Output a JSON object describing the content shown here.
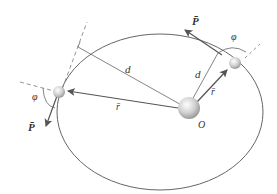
{
  "diagram": {
    "labels": {
      "momentum_right": "P̄",
      "momentum_left": "P̄",
      "angle_right": "φ",
      "angle_left": "φ",
      "distance_upper": "d",
      "distance_right": "d",
      "radius_left": "r̄",
      "radius_right": "r̄",
      "origin": "O"
    },
    "colors": {
      "orbit": "#555555",
      "arrow": "#555555",
      "dashed": "#777777",
      "body": "#cccccc"
    }
  }
}
